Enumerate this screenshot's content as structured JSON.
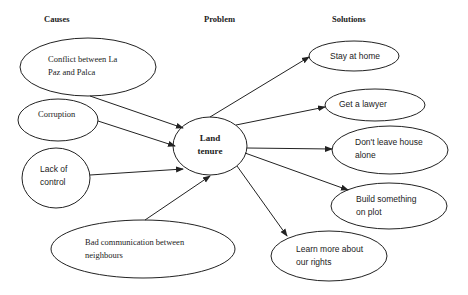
{
  "headers": {
    "causes": "Causes",
    "problem": "Problem",
    "solutions": "Solutions"
  },
  "problem": {
    "line1": "Land",
    "line2": "tenure"
  },
  "causes": [
    {
      "line1": "Conflict between La",
      "line2": "Paz and Palca"
    },
    {
      "line1": "Corruption",
      "line2": ""
    },
    {
      "line1": "Lack of",
      "line2": "control"
    },
    {
      "line1": "Bad communication between",
      "line2": "neighbours"
    }
  ],
  "solutions": [
    {
      "line1": "Stay at home",
      "line2": ""
    },
    {
      "line1": "Get a lawyer",
      "line2": ""
    },
    {
      "line1": "Don't leave house",
      "line2": "alone"
    },
    {
      "line1": "Build something",
      "line2": "on plot"
    },
    {
      "line1": "Learn more about",
      "line2": "our rights"
    }
  ],
  "colors": {
    "stroke": "#222222",
    "background": "#ffffff"
  }
}
